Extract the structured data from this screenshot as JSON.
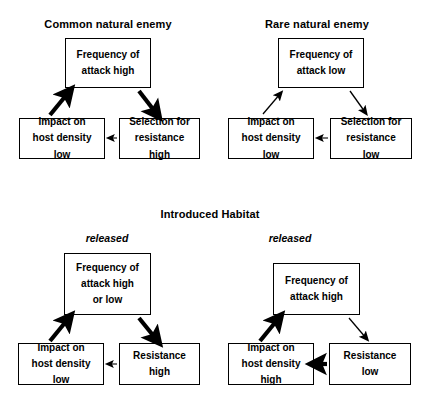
{
  "figure": {
    "section_title": "Introduced Habitat",
    "panels": [
      {
        "id": "common-natural-enemy",
        "title": "Common natural enemy",
        "released_label": "",
        "nodes": {
          "top": [
            "Frequency of",
            "attack high"
          ],
          "left": [
            "Impact on",
            "host density",
            "low"
          ],
          "right": [
            "Selection for",
            "resistance",
            "high"
          ]
        },
        "edges": [
          {
            "from": "top",
            "to": "right",
            "weight": "thick"
          },
          {
            "from": "right",
            "to": "left",
            "weight": "thin"
          },
          {
            "from": "left",
            "to": "top",
            "weight": "thick"
          }
        ]
      },
      {
        "id": "rare-natural-enemy",
        "title": "Rare natural enemy",
        "released_label": "",
        "nodes": {
          "top": [
            "Frequency of",
            "attack low"
          ],
          "left": [
            "Impact on",
            "host density",
            "low"
          ],
          "right": [
            "Selection for",
            "resistance",
            "low"
          ]
        },
        "edges": [
          {
            "from": "top",
            "to": "right",
            "weight": "thin"
          },
          {
            "from": "right",
            "to": "left",
            "weight": "thin"
          },
          {
            "from": "left",
            "to": "top",
            "weight": "thin"
          }
        ]
      },
      {
        "id": "introduced-habitat-left",
        "title": "",
        "released_label": "released",
        "nodes": {
          "top": [
            "Frequency of",
            "attack high",
            "or low"
          ],
          "left": [
            "Impact on",
            "host density",
            "low"
          ],
          "right": [
            "Resistance",
            "high"
          ]
        },
        "edges": [
          {
            "from": "top",
            "to": "right",
            "weight": "thick"
          },
          {
            "from": "right",
            "to": "left",
            "weight": "thin"
          },
          {
            "from": "left",
            "to": "top",
            "weight": "thick"
          }
        ]
      },
      {
        "id": "introduced-habitat-right",
        "title": "",
        "released_label": "released",
        "nodes": {
          "top": [
            "Frequency of",
            "attack high"
          ],
          "left": [
            "Impact on",
            "host density",
            "high"
          ],
          "right": [
            "Resistance",
            "low"
          ]
        },
        "edges": [
          {
            "from": "top",
            "to": "right",
            "weight": "thin"
          },
          {
            "from": "right",
            "to": "left",
            "weight": "thick"
          },
          {
            "from": "left",
            "to": "top",
            "weight": "thick"
          }
        ]
      }
    ],
    "colors": {
      "stroke": "#000000",
      "text": "#000000",
      "background": "#ffffff"
    }
  }
}
